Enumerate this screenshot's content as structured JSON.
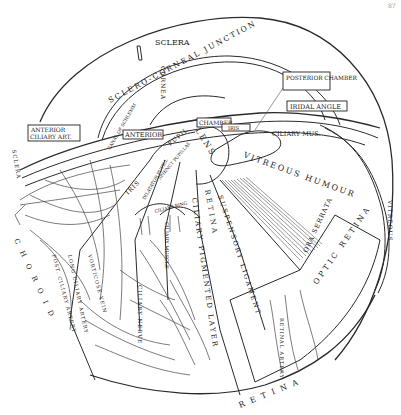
{
  "page": {
    "page_number": "87"
  },
  "diagram": {
    "labels": {
      "sclera": "SCLERA",
      "sclero_corneal_junction": "SCLERO-CORNEAL JUNCTION",
      "cornea": "CORNEA",
      "posterior_chamber": "POSTERIOR CHAMBER",
      "iridal_angle": "IRIDAL ANGLE",
      "chamber": "CHAMBER",
      "iris_small": "IRIS",
      "ciliary_mus": "CILIARY MUS.",
      "anterior_ciliary_art": "ANTERIOR CILIARY ART.",
      "anterior": "ANTERIOR",
      "pupil": "PUPIL",
      "lens": "LENS",
      "vitreous_humour": "VITREOUS HUMOUR",
      "vitreous_right": "VITREOUS",
      "iris": "IRIS",
      "sphincter_pupillae": "SPHINCT PUPILLAE",
      "dilatator_pupillae": "DILATATOR PUPILL",
      "ciliary_ring": "CILIARY RING",
      "ciliary_muscle": "CILIARY MUSCLE",
      "ciliary_nerve": "CILIARY NERVE",
      "ciliary_pigmented_layer": "CILIARY PIGMENTED LAYER",
      "retina_ciliary": "RETINA",
      "suspensory_ligament": "SUSPENSORY LIGAMENT",
      "ora_serrata": "ORA SERRATA",
      "optic_retina": "OPTIC RETINA",
      "retinal_artery": "RETINAL ARTERY",
      "retina_bottom": "RETINA",
      "choroid": "CHOROID",
      "sclera_left": "SCLERA",
      "schlemm": "CANAL OF SCHLEMM",
      "posterior_ciliary_artery": "POST. CILIARY ARTERY",
      "long_ciliary_artery": "LONG CILIARY ARTERY",
      "vorticose_vein": "VORTICOSE VEIN",
      "ciliary_body": "CILIARY BODY",
      "ciliary_processes": "CILIARY PROCESSES"
    }
  }
}
